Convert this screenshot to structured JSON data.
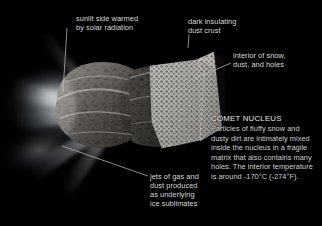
{
  "figure": {
    "background_color": "#000000",
    "label_color": "#d9d9d9",
    "leader_line_color": "#bdbdbd",
    "width": 322,
    "height": 226
  },
  "callouts": [
    {
      "id": "sunlit",
      "text": "sunlit side warmed\nby solar radiation",
      "leader": "vertical line descending to upper-left limb of nucleus"
    },
    {
      "id": "crust",
      "text": "dark insulating\ndust crust",
      "leader": "short vertical line descending to dark cratered surface"
    },
    {
      "id": "interior",
      "text": "interior of snow,\ndust, and holes",
      "leader": "diagonal line to bright porous cutaway face"
    },
    {
      "id": "jets",
      "text": "jets of gas and\ndust produced\nas underlying\nice sublimates",
      "leader": "long diagonal line to glowing jets at lower left"
    }
  ],
  "panel": {
    "heading": "COMET NUCLEUS",
    "body": "Particles of fluffy snow and dusty dirt are intimately mixed inside the nucleus in a fragile matrix that also contains many holes. The interior temperature is around -170°C (-274°F)."
  },
  "art_elements": {
    "nucleus": "elongated peanut-shaped body, dark pitted dust crust on left lobe",
    "cutaway": "bright speckled wedge on right revealing porous snow-and-dust interior",
    "coma": "diffuse white glow at left",
    "jets": "bright fan-shaped gas and dust jets emanating left and lower-left"
  }
}
